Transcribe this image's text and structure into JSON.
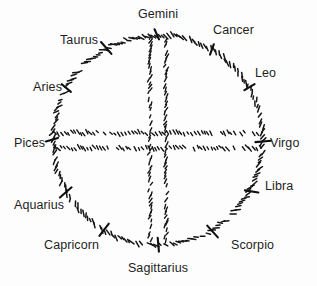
{
  "diagram": {
    "type": "zodiac-wheel",
    "style": "hand-drawn sketch, hatched strokes, black ink on off-white",
    "background_color": "#fdfdfd",
    "ink_color": "#151515",
    "circle": {
      "center_x": 158,
      "center_y": 140,
      "radius": 105
    },
    "axes": {
      "vertical_lines_x": [
        150,
        166
      ],
      "horizontal_lines_y": [
        133,
        148
      ]
    },
    "signs": [
      {
        "name": "Gemini",
        "position": "top"
      },
      {
        "name": "Cancer",
        "position": "top-right"
      },
      {
        "name": "Leo",
        "position": "upper-right"
      },
      {
        "name": "Virgo",
        "position": "right"
      },
      {
        "name": "Libra",
        "position": "lower-right"
      },
      {
        "name": "Scorpio",
        "position": "bottom-right"
      },
      {
        "name": "Sagittarius",
        "position": "bottom"
      },
      {
        "name": "Capricorn",
        "position": "bottom-left"
      },
      {
        "name": "Aquarius",
        "position": "lower-left"
      },
      {
        "name": "Pices",
        "position": "left"
      },
      {
        "name": "Aries",
        "position": "upper-left"
      },
      {
        "name": "Taurus",
        "position": "top-left"
      }
    ]
  }
}
